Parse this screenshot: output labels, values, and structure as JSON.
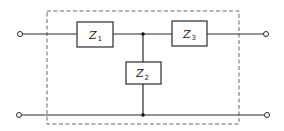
{
  "diagram": {
    "type": "two-port T-network",
    "colors": {
      "line": "#2a2a2a",
      "boundary": "#555555",
      "background": "#ffffff"
    },
    "components": [
      {
        "id": "Z1",
        "symbol": "Z",
        "subscript": "1",
        "position": "series-left"
      },
      {
        "id": "Z2",
        "symbol": "Z",
        "subscript": "2",
        "position": "shunt"
      },
      {
        "id": "Z3",
        "symbol": "Z",
        "subscript": "3",
        "position": "series-right"
      }
    ],
    "terminals": [
      "input-top",
      "input-bottom",
      "output-top",
      "output-bottom"
    ],
    "junctions": [
      "top-node",
      "bottom-node"
    ],
    "boundary": "dashed rectangle enclosing network"
  }
}
